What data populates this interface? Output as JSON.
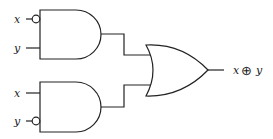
{
  "diagram": {
    "type": "logic-circuit",
    "gates": [
      {
        "id": "and_top",
        "type": "AND",
        "inputs": [
          {
            "label": "x",
            "inverted": true
          },
          {
            "label": "y",
            "inverted": false
          }
        ]
      },
      {
        "id": "and_bottom",
        "type": "AND",
        "inputs": [
          {
            "label": "x",
            "inverted": false
          },
          {
            "label": "y",
            "inverted": true
          }
        ]
      },
      {
        "id": "or_out",
        "type": "OR",
        "inputs": [
          "and_top",
          "and_bottom"
        ]
      }
    ],
    "labels": {
      "top_x": "x",
      "top_y": "y",
      "bottom_x": "x",
      "bottom_y": "y",
      "output_left": "x",
      "output_op": "⊕",
      "output_right": "y"
    },
    "colors": {
      "line": "#222222",
      "background": "#ffffff"
    }
  }
}
